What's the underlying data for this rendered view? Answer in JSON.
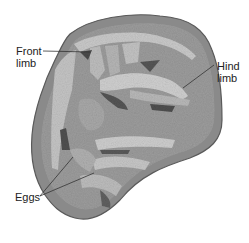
{
  "figure": {
    "labels": {
      "front_limb": [
        "Front",
        "limb"
      ],
      "hind_limb": [
        "Hind",
        "limb"
      ],
      "eggs": "Eggs"
    },
    "colors": {
      "background": "#ffffff",
      "rim": "#8a8a8a",
      "matrix": "#9a9a9a",
      "bone_light": "#c8c8c8",
      "shadow": "#4a4a4a",
      "leader_line": "#333333",
      "text": "#222222"
    }
  }
}
